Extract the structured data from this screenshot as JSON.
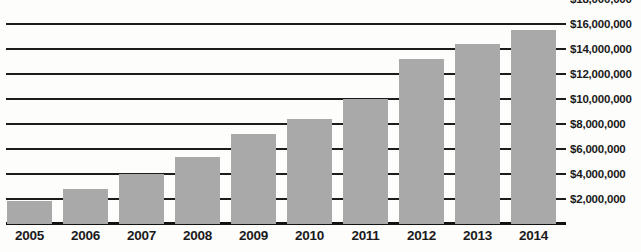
{
  "chart_data": {
    "type": "bar",
    "title": "",
    "subtitle": "",
    "xlabel": "",
    "ylabel": "",
    "categories": [
      "2005",
      "2006",
      "2007",
      "2008",
      "2009",
      "2010",
      "2011",
      "2012",
      "2013",
      "2014"
    ],
    "values": [
      1800000,
      2800000,
      4000000,
      5300000,
      7200000,
      8400000,
      10000000,
      13200000,
      14400000,
      15500000
    ],
    "value_labels": [
      "$1,800,000",
      "$2,800,000",
      "$4,000,000",
      "$5,300,000",
      "$7,200,000",
      "$8,400,000",
      "$10,000,000",
      "$13,200,000",
      "$14,400,000",
      "$15,500,000"
    ],
    "ylim": [
      0,
      19000000
    ],
    "y_ticks": [
      2000000,
      4000000,
      6000000,
      8000000,
      10000000,
      12000000,
      14000000,
      16000000,
      18000000
    ],
    "y_tick_labels": [
      "$2,000,000",
      "$4,000,000",
      "$6,000,000",
      "$8,000,000",
      "$10,000,000",
      "$12,000,000",
      "$14,000,000",
      "$16,000,000",
      "$18,000,000"
    ],
    "grid": true,
    "grid_orientation": "horizontal",
    "legend": false,
    "legend_position": "none",
    "bar_color": "#a9a9a9",
    "grid_color": "#1c1c1c",
    "axis_color": "#121212",
    "text_color": "#1a1a1a",
    "background_color": "#fdfdfc"
  }
}
